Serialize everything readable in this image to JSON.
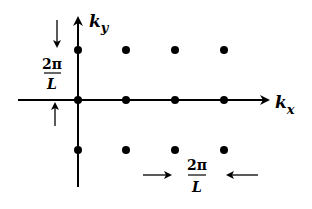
{
  "diagram": {
    "axes": {
      "x_label": "k",
      "x_subscript": "x",
      "y_label": "k",
      "y_subscript": "y"
    },
    "spacing_label_left": {
      "numerator": "2π",
      "denominator": "L"
    },
    "spacing_label_bottom": {
      "numerator": "2π",
      "denominator": "L"
    },
    "colors": {
      "ink": "#000000",
      "background": "#ffffff"
    },
    "lattice_points": [
      {
        "col": 0,
        "row": 1
      },
      {
        "col": 1,
        "row": 1
      },
      {
        "col": 2,
        "row": 1
      },
      {
        "col": 3,
        "row": 1
      },
      {
        "col": 0,
        "row": 0
      },
      {
        "col": 1,
        "row": 0
      },
      {
        "col": 2,
        "row": 0
      },
      {
        "col": 3,
        "row": 0
      },
      {
        "col": 0,
        "row": -1
      },
      {
        "col": 1,
        "row": -1
      },
      {
        "col": 2,
        "row": -1
      },
      {
        "col": 3,
        "row": -1
      }
    ]
  }
}
